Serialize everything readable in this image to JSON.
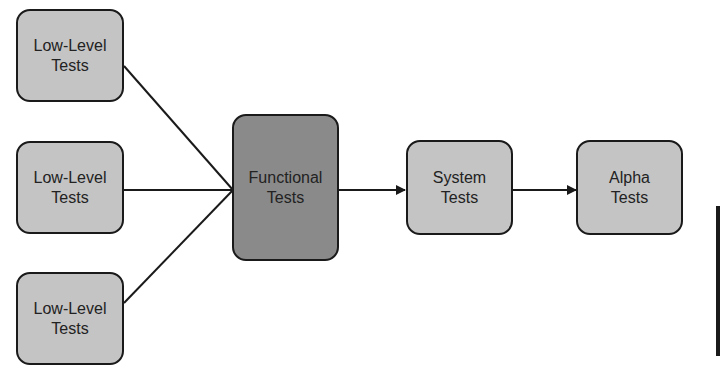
{
  "diagram": {
    "nodes": [
      {
        "id": "low1",
        "line1": "Low-Level",
        "line2": "Tests"
      },
      {
        "id": "low2",
        "line1": "Low-Level",
        "line2": "Tests"
      },
      {
        "id": "low3",
        "line1": "Low-Level",
        "line2": "Tests"
      },
      {
        "id": "functional",
        "line1": "Functional",
        "line2": "Tests"
      },
      {
        "id": "system",
        "line1": "System",
        "line2": "Tests"
      },
      {
        "id": "alpha",
        "line1": "Alpha",
        "line2": "Tests"
      }
    ],
    "edges": [
      {
        "from": "low1",
        "to": "functional"
      },
      {
        "from": "low2",
        "to": "functional"
      },
      {
        "from": "low3",
        "to": "functional"
      },
      {
        "from": "functional",
        "to": "system"
      },
      {
        "from": "system",
        "to": "alpha"
      }
    ],
    "colors": {
      "low_level_fill": "#c4c4c4",
      "functional_fill": "#8a8a8a",
      "border": "#1a1a1a"
    }
  }
}
